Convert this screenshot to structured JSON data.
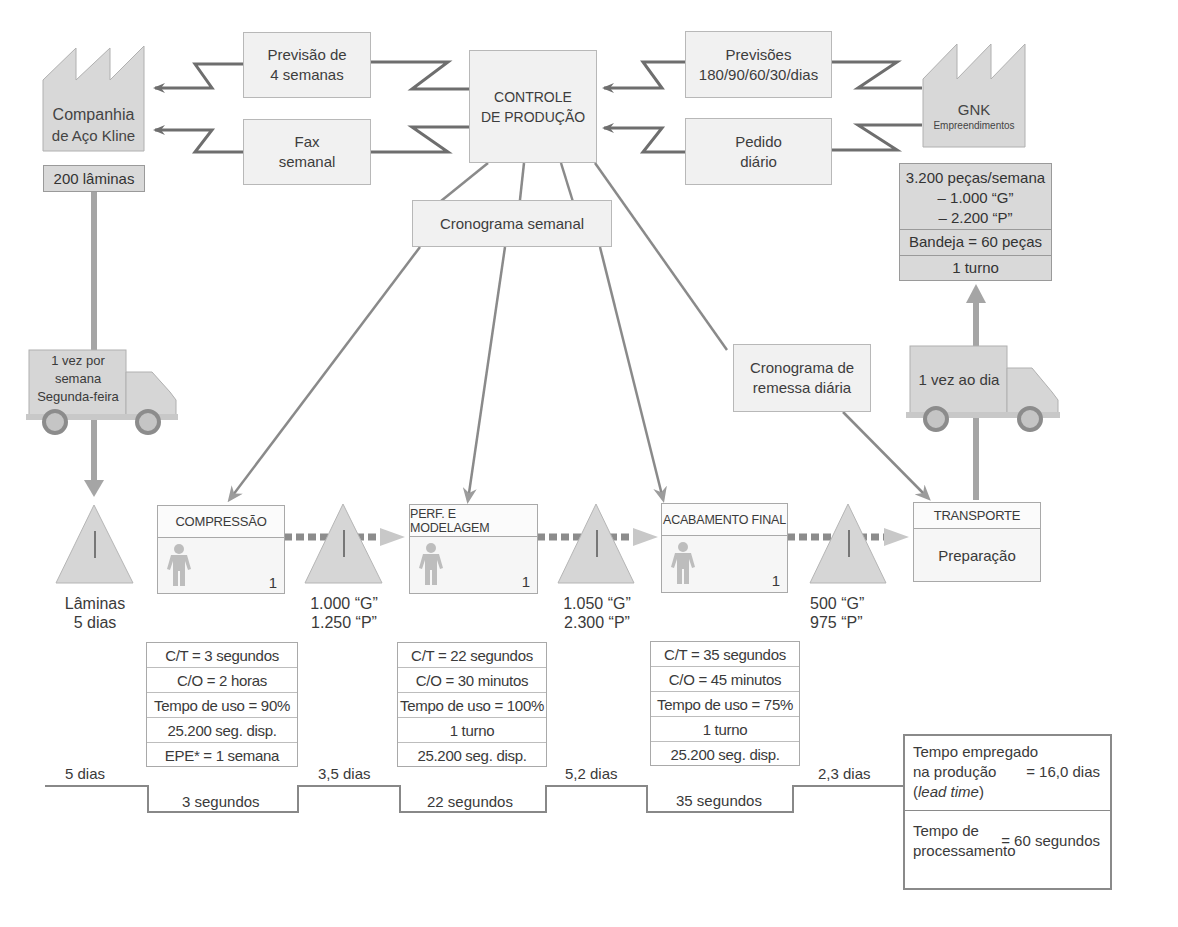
{
  "supplier": {
    "name_line1": "Companhia",
    "name_line2": "de Aço Kline",
    "inventory": "200 lâminas"
  },
  "customer": {
    "name": "GNK",
    "subname": "Empreendimentos",
    "demand": [
      "3.200 peças/semana",
      "– 1.000 “G”",
      "– 2.200 “P”"
    ],
    "tray": "Bandeja = 60 peças",
    "shift": "1 turno"
  },
  "control": {
    "line1": "CONTROLE",
    "line2": "DE PRODUÇÃO"
  },
  "info_flows": {
    "forecast_supplier": [
      "Previsão de",
      "4 semanas"
    ],
    "fax": [
      "Fax",
      "semanal"
    ],
    "forecast_customer": [
      "Previsões",
      "180/90/60/30/dias"
    ],
    "daily_order": [
      "Pedido",
      "diário"
    ],
    "weekly_schedule": "Cronograma semanal",
    "daily_shipping": [
      "Cronograma de",
      "remessa diária"
    ]
  },
  "trucks": {
    "inbound": [
      "1 vez por",
      "semana",
      "Segunda-feira"
    ],
    "outbound": "1 vez ao dia"
  },
  "inventories": [
    {
      "symbol": "I",
      "line1": "Lâminas",
      "line2": "5 dias"
    },
    {
      "symbol": "I",
      "line1": "1.000 “G”",
      "line2": "1.250 “P”"
    },
    {
      "symbol": "I",
      "line1": "1.050 “G”",
      "line2": "2.300 “P”"
    },
    {
      "symbol": "I",
      "line1": "500 “G”",
      "line2": "975 “P”"
    }
  ],
  "processes": [
    {
      "name": "COMPRESSÃO",
      "operators": "1",
      "data": [
        "C/T = 3 segundos",
        "C/O = 2 horas",
        "Tempo de uso = 90%",
        "25.200 seg. disp.",
        "EPE* = 1 semana"
      ]
    },
    {
      "name": "PERF. E MODELAGEM",
      "operators": "1",
      "data": [
        "C/T = 22 segundos",
        "C/O = 30 minutos",
        "Tempo de uso = 100%",
        "1 turno",
        "25.200 seg. disp."
      ]
    },
    {
      "name": "ACABAMENTO FINAL",
      "operators": "1",
      "data": [
        "C/T = 35 segundos",
        "C/O = 45 minutos",
        "Tempo de uso = 75%",
        "1 turno",
        "25.200 seg. disp."
      ]
    },
    {
      "name": "TRANSPORTE",
      "body": "Preparação"
    }
  ],
  "timeline": {
    "waits": [
      "5 dias",
      "3,5 dias",
      "5,2 dias",
      "2,3 dias"
    ],
    "process_times": [
      "3 segundos",
      "22 segundos",
      "35 segundos"
    ]
  },
  "summary": {
    "lead_line1": "Tempo empregado",
    "lead_line2": "na produção",
    "lead_line3_italic": "lead time",
    "lead_value": "= 16,0 dias",
    "proc_line1": "Tempo de",
    "proc_line2": "processamento",
    "proc_value": "= 60 segundos"
  },
  "colors": {
    "box_fill": "#f1f1f1",
    "shape_fill": "#d6d6d6",
    "line": "#777777",
    "arrow": "#9a9a9a"
  }
}
